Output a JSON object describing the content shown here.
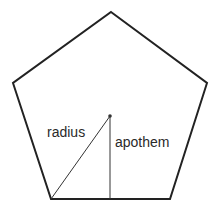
{
  "diagram": {
    "shape": "regular pentagon",
    "labels": {
      "radius": "radius",
      "apothem": "apothem"
    },
    "colors": {
      "stroke": "#222222",
      "background": "#ffffff"
    }
  }
}
